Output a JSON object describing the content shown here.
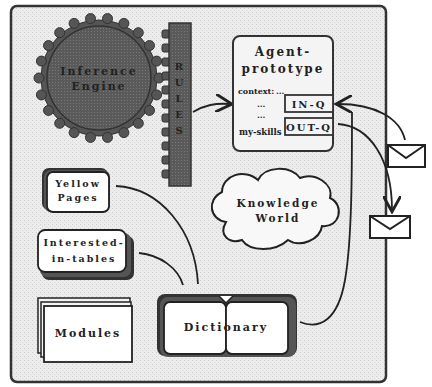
{
  "diagram": {
    "inference_engine": {
      "line1": "Inference",
      "line2": "Engine"
    },
    "rules": {
      "letters": [
        "R",
        "U",
        "L",
        "E",
        "S"
      ]
    },
    "agent_prototype": {
      "title_line1": "Agent-",
      "title_line2": "prototype",
      "context_label": "context:",
      "context_dots": "...",
      "dots1": "...",
      "dots2": "...",
      "my_skills_label": "my-skills",
      "in_q": "IN-Q",
      "out_q": "OUT-Q"
    },
    "yellow_pages": {
      "line1": "Yellow",
      "line2": "Pages"
    },
    "interested_in_tables": {
      "line1": "Interested-",
      "line2": "in-tables"
    },
    "modules": {
      "label": "Modules"
    },
    "dictionary": {
      "label": "Dictionary"
    },
    "knowledge_world": {
      "line1": "Knowledge",
      "line2": "World"
    },
    "colors": {
      "frame": "#333333",
      "background": "#e8e8e8",
      "gear": "#555555",
      "rules": "#555555"
    }
  }
}
